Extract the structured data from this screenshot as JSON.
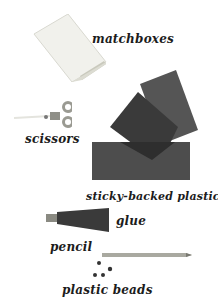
{
  "items": [
    {
      "id": "matchboxes",
      "label": "matchboxes"
    },
    {
      "id": "scissors",
      "label": "scissors"
    },
    {
      "id": "sticky-backed-plastic",
      "label": "sticky-backed plastic"
    },
    {
      "id": "glue",
      "label": "glue"
    },
    {
      "id": "pencil",
      "label": "pencil"
    },
    {
      "id": "plastic-beads",
      "label": "plastic beads"
    }
  ],
  "colors": {
    "matchbox": "#efefe9",
    "matchbox_tray": "#cfcfc4",
    "scissors_handle": "#9a9a92",
    "plastic_dark": "#2e2e2e",
    "plastic_mid": "#3f3f3f",
    "plastic_light": "#555555",
    "glue_tube": "#3a3a3a",
    "pencil": "#a9a9a0",
    "beads": "#333333"
  }
}
